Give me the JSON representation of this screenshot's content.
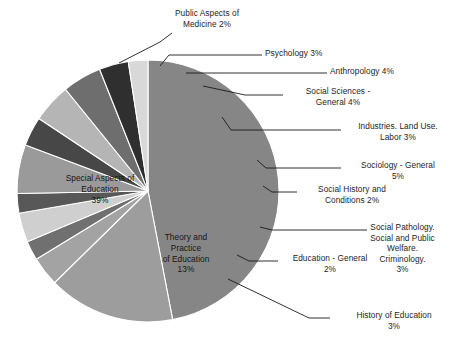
{
  "chart_data": {
    "type": "pie",
    "title": "",
    "subtitle": "",
    "xlabel": "",
    "ylabel": "",
    "legend_position": "none",
    "grid": false,
    "units": "percent",
    "total": 100,
    "categories": [
      "Special Aspects of Education",
      "Theory and Practice of Education",
      "History of Education",
      "Education - General",
      "Social Pathology. Social and Public Welfare. Criminology.",
      "Social History and Conditions",
      "Sociology - General",
      "Industries. Land Use. Labor",
      "Social Sciences - General",
      "Anthropology",
      "Psychology",
      "Public Aspects of Medicine"
    ],
    "values": [
      39,
      13,
      3,
      2,
      3,
      2,
      5,
      3,
      4,
      4,
      3,
      2
    ],
    "slice_colors": [
      "#868686",
      "#9d9d9d",
      "#a3a3a3",
      "#707070",
      "#cfcfcf",
      "#585858",
      "#9a9a9a",
      "#474747",
      "#b5b5b5",
      "#6e6e6e",
      "#2f2f2f",
      "#d8d8d8"
    ]
  },
  "callouts": [
    {
      "id": "public-aspects-of-medicine",
      "text": "Public Aspects of\nMedicine  2%",
      "align": "center",
      "x": 144,
      "y": 8,
      "w": 126,
      "leader": [
        [
          172,
          33
        ],
        [
          160,
          42
        ],
        [
          119,
          63
        ]
      ]
    },
    {
      "id": "psychology",
      "text": "Psychology 3%",
      "align": "left",
      "x": 265,
      "y": 48,
      "w": 110,
      "leader": [
        [
          262,
          55
        ],
        [
          169,
          55
        ],
        [
          160,
          66
        ]
      ]
    },
    {
      "id": "anthropology",
      "text": "Anthropology 4%",
      "align": "left",
      "x": 330,
      "y": 66,
      "w": 124,
      "leader": [
        [
          327,
          73
        ],
        [
          186,
          73
        ]
      ]
    },
    {
      "id": "social-sciences-general",
      "text": "Social Sciences -\nGeneral  4%",
      "align": "center",
      "x": 276,
      "y": 86,
      "w": 124,
      "leader": [
        [
          283,
          95
        ],
        [
          245,
          95
        ],
        [
          203,
          86
        ]
      ]
    },
    {
      "id": "industries-land-use-labor",
      "text": "Industries. Land Use.\nLabor 3%",
      "align": "center",
      "x": 338,
      "y": 121,
      "w": 120,
      "leader": [
        [
          341,
          130
        ],
        [
          231,
          130
        ],
        [
          222,
          117
        ]
      ]
    },
    {
      "id": "sociology-general",
      "text": "Sociology - General\n5%",
      "align": "center",
      "x": 338,
      "y": 160,
      "w": 120,
      "leader": [
        [
          341,
          168
        ],
        [
          266,
          168
        ],
        [
          257,
          160
        ]
      ]
    },
    {
      "id": "social-history-and-conditions",
      "text": "Social History and\nConditions 2%",
      "align": "center",
      "x": 294,
      "y": 184,
      "w": 116,
      "leader": [
        [
          297,
          192
        ],
        [
          272,
          192
        ],
        [
          263,
          186
        ]
      ]
    },
    {
      "id": "social-pathology-welfare-criminology",
      "text": "Social Pathology.\nSocial and Public\nWelfare.\nCriminology.\n3%",
      "align": "center",
      "x": 345,
      "y": 222,
      "w": 115,
      "leader": [
        [
          367,
          230
        ],
        [
          272,
          230
        ],
        [
          260,
          227
        ]
      ]
    },
    {
      "id": "education-general",
      "text": "Education - General\n2%",
      "align": "center",
      "x": 275,
      "y": 253,
      "w": 110,
      "leader": [
        [
          278,
          261
        ],
        [
          249,
          261
        ],
        [
          237,
          255
        ]
      ]
    },
    {
      "id": "history-of-education",
      "text": "History of Education\n3%",
      "align": "center",
      "x": 330,
      "y": 310,
      "w": 128,
      "leader": [
        [
          330,
          318
        ],
        [
          309,
          318
        ],
        [
          228,
          279
        ]
      ]
    }
  ],
  "inner_labels": [
    {
      "id": "special-aspects-of-education",
      "text": "Special Aspects of\nEducation\n39%",
      "x": 42,
      "y": 173,
      "w": 116
    },
    {
      "id": "theory-and-practice-of-education",
      "text": "Theory and\nPractice\nof Education\n13%",
      "x": 136,
      "y": 232,
      "w": 100
    }
  ],
  "geometry": {
    "cx": 148,
    "cy": 191,
    "r": 131,
    "start_angle_deg": -90,
    "direction": "clockwise"
  }
}
